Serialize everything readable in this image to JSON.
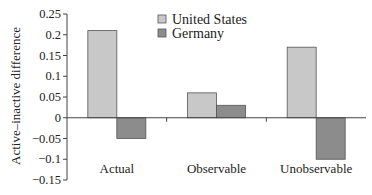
{
  "chart_data": {
    "type": "bar",
    "title": "",
    "xlabel": "",
    "ylabel": "Active–inactive difference",
    "categories": [
      "Actual",
      "Observable",
      "Unobservable"
    ],
    "series": [
      {
        "name": "United States",
        "color": "#c8c8c8",
        "values": [
          0.21,
          0.06,
          0.17
        ]
      },
      {
        "name": "Germany",
        "color": "#8c8c8c",
        "values": [
          -0.05,
          0.03,
          -0.1
        ]
      }
    ],
    "ylim": [
      -0.15,
      0.25
    ],
    "yticks": [
      0.25,
      0.2,
      0.15,
      0.1,
      0.05,
      0,
      -0.05,
      -0.1,
      -0.15
    ],
    "ytick_labels": [
      "0.25",
      "0.2",
      "0.15",
      "0.1",
      "0.05",
      "0",
      "−0.05",
      "−0.1",
      "−0.15"
    ],
    "grid": false,
    "legend": {
      "position": "top-center",
      "entries": [
        "United States",
        "Germany"
      ]
    }
  }
}
